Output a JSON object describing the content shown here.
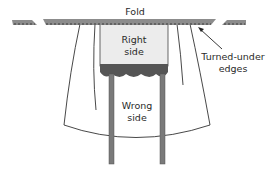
{
  "diagram": {
    "labels": {
      "fold": "Fold",
      "right_side_line1": "Right",
      "right_side_line2": "side",
      "wrong_side_line1": "Wrong",
      "wrong_side_line2": "side",
      "turned_under_line1": "Turned-under",
      "turned_under_line2": "edges"
    },
    "colors": {
      "fold_bar": "#8c8c8c",
      "fold_bar_stitch": "#3a3a3a",
      "right_side_fill": "#ececec",
      "band_fill": "#555555",
      "post_fill": "#7a7a7a",
      "outline": "#333333"
    }
  }
}
